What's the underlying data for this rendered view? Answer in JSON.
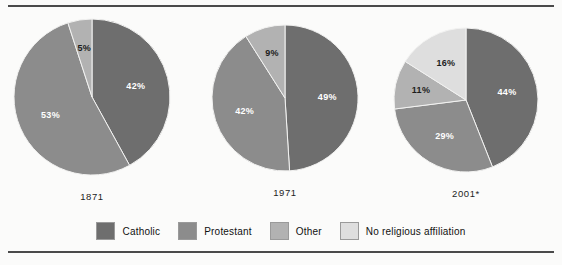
{
  "figure": {
    "background": "#fbfbfa",
    "rule_color": "#4a4a4a"
  },
  "palette": {
    "catholic": "#6e6e6e",
    "protestant": "#8c8c8c",
    "other": "#b2b2b2",
    "none": "#dedede",
    "label_light": "#ffffff",
    "label_dark": "#1d1d1d"
  },
  "legend": {
    "items": [
      {
        "label": "Catholic",
        "color": "#6e6e6e",
        "swatch_name": "legend-swatch-catholic"
      },
      {
        "label": "Protestant",
        "color": "#8c8c8c",
        "swatch_name": "legend-swatch-protestant"
      },
      {
        "label": "Other",
        "color": "#b2b2b2",
        "swatch_name": "legend-swatch-other"
      },
      {
        "label": "No religious affiliation",
        "color": "#dedede",
        "swatch_name": "legend-swatch-none"
      }
    ]
  },
  "chart_data": {
    "type": "pie",
    "title": "",
    "subtitle": "",
    "xlabel": "",
    "ylabel": "",
    "legend_position": "bottom",
    "grid": false,
    "units": "percent",
    "start_angle_deg": 0,
    "direction": "clockwise",
    "categories": [
      "Catholic",
      "Protestant",
      "Other",
      "No religious affiliation"
    ],
    "category_colors": [
      "#6e6e6e",
      "#8c8c8c",
      "#b2b2b2",
      "#dedede"
    ],
    "charts": [
      {
        "name": "pie-1871",
        "year_label": "1871",
        "center_x": 92,
        "center_y": 85,
        "radius": 78,
        "slices": [
          {
            "category": "Catholic",
            "value": 42,
            "label": "42%",
            "color": "#6e6e6e",
            "label_color": "light"
          },
          {
            "category": "Protestant",
            "value": 53,
            "label": "53%",
            "color": "#8c8c8c",
            "label_color": "light"
          },
          {
            "category": "Other",
            "value": 5,
            "label": "5%",
            "color": "#b2b2b2",
            "label_color": "dark"
          }
        ]
      },
      {
        "name": "pie-1971",
        "year_label": "1971",
        "center_x": 285,
        "center_y": 86,
        "radius": 73,
        "slices": [
          {
            "category": "Catholic",
            "value": 49,
            "label": "49%",
            "color": "#6e6e6e",
            "label_color": "light"
          },
          {
            "category": "Protestant",
            "value": 42,
            "label": "42%",
            "color": "#8c8c8c",
            "label_color": "light"
          },
          {
            "category": "Other",
            "value": 9,
            "label": "9%",
            "color": "#b2b2b2",
            "label_color": "dark"
          }
        ]
      },
      {
        "name": "pie-2001",
        "year_label": "2001*",
        "center_x": 466,
        "center_y": 88,
        "radius": 72,
        "slices": [
          {
            "category": "Catholic",
            "value": 44,
            "label": "44%",
            "color": "#6e6e6e",
            "label_color": "light"
          },
          {
            "category": "Protestant",
            "value": 29,
            "label": "29%",
            "color": "#8c8c8c",
            "label_color": "light"
          },
          {
            "category": "Other",
            "value": 11,
            "label": "11%",
            "color": "#b2b2b2",
            "label_color": "dark"
          },
          {
            "category": "No religious affiliation",
            "value": 16,
            "label": "16%",
            "color": "#dedede",
            "label_color": "dark"
          }
        ]
      }
    ]
  }
}
